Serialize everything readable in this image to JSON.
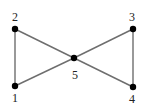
{
  "diagram": {
    "type": "graph",
    "nodes": [
      {
        "id": "1",
        "label": "1",
        "x": 15,
        "y": 86,
        "label_x": 15,
        "label_y": 102
      },
      {
        "id": "2",
        "label": "2",
        "x": 15,
        "y": 29,
        "label_x": 15,
        "label_y": 21
      },
      {
        "id": "3",
        "label": "3",
        "x": 133,
        "y": 29,
        "label_x": 132,
        "label_y": 21
      },
      {
        "id": "4",
        "label": "4",
        "x": 133,
        "y": 87,
        "label_x": 132,
        "label_y": 103
      },
      {
        "id": "5",
        "label": "5",
        "x": 74,
        "y": 58,
        "label_x": 75,
        "label_y": 79
      }
    ],
    "edges": [
      {
        "from": "1",
        "to": "2"
      },
      {
        "from": "2",
        "to": "5"
      },
      {
        "from": "1",
        "to": "5"
      },
      {
        "from": "3",
        "to": "5"
      },
      {
        "from": "4",
        "to": "5"
      },
      {
        "from": "3",
        "to": "4"
      }
    ],
    "colors": {
      "edge": "#6e6e6e",
      "node": "#000000",
      "label": "#222222",
      "background": "#ffffff"
    }
  }
}
